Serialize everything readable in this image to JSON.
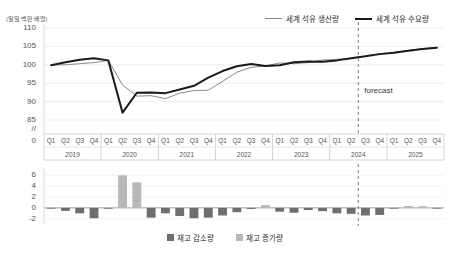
{
  "chart_data": [
    {
      "type": "line",
      "title": "",
      "ylabel": "(일일 백만 배럴)",
      "xlabel": "",
      "ylim": [
        83,
        110
      ],
      "yticks": [
        110,
        105,
        100,
        95,
        90,
        85
      ],
      "axis_break": "//",
      "axis_zero": "0",
      "grid": true,
      "legend_position": "top-right",
      "x": [
        "Q1",
        "Q2",
        "Q3",
        "Q4",
        "Q1",
        "Q2",
        "Q3",
        "Q4",
        "Q1",
        "Q2",
        "Q3",
        "Q4",
        "Q1",
        "Q2",
        "Q3",
        "Q4",
        "Q1",
        "Q2",
        "Q3",
        "Q4",
        "Q1",
        "Q2",
        "Q3",
        "Q4",
        "Q1",
        "Q2",
        "Q3",
        "Q4"
      ],
      "year_groups": [
        {
          "year": "2019",
          "quarters": [
            "Q1",
            "Q2",
            "Q3",
            "Q4"
          ]
        },
        {
          "year": "2020",
          "quarters": [
            "Q1",
            "Q2",
            "Q3",
            "Q4"
          ]
        },
        {
          "year": "2021",
          "quarters": [
            "Q1",
            "Q2",
            "Q3",
            "Q4"
          ]
        },
        {
          "year": "2022",
          "quarters": [
            "Q1",
            "Q2",
            "Q3",
            "Q4"
          ]
        },
        {
          "year": "2023",
          "quarters": [
            "Q1",
            "Q2",
            "Q3",
            "Q4"
          ]
        },
        {
          "year": "2024",
          "quarters": [
            "Q1",
            "Q2",
            "Q3",
            "Q4"
          ]
        },
        {
          "year": "2025",
          "quarters": [
            "Q1",
            "Q2",
            "Q3",
            "Q4"
          ]
        }
      ],
      "annotations": [
        {
          "text": "forecast",
          "at_x_index": 21.5
        }
      ],
      "series": [
        {
          "name": "세계 석유 생산량",
          "color": "#8a8a8a",
          "width": 1,
          "values": [
            100.0,
            100.0,
            100.3,
            100.6,
            101.2,
            94.5,
            91.5,
            91.6,
            90.8,
            92.3,
            93.0,
            93.1,
            95.5,
            98.0,
            99.3,
            99.7,
            100.5,
            100.3,
            100.6,
            101.3,
            101.5,
            101.7,
            102.4,
            103.0,
            103.4,
            103.9,
            104.4,
            104.7
          ]
        },
        {
          "name": "세계 석유 수요량",
          "color": "#1a1a1a",
          "width": 2,
          "values": [
            99.9,
            100.7,
            101.4,
            101.8,
            101.2,
            87.0,
            92.4,
            92.5,
            92.3,
            93.3,
            94.3,
            96.5,
            98.3,
            99.6,
            100.2,
            99.7,
            99.9,
            100.7,
            100.9,
            100.8,
            101.2,
            101.8,
            102.3,
            102.9,
            103.3,
            103.8,
            104.3,
            104.6
          ]
        }
      ]
    },
    {
      "type": "bar",
      "title": "",
      "ylim": [
        -2.6,
        6.6
      ],
      "yticks": [
        6,
        4,
        2,
        0,
        -2
      ],
      "grid": true,
      "legend_position": "bottom-center",
      "categories": [
        "Q1",
        "Q2",
        "Q3",
        "Q4",
        "Q1",
        "Q2",
        "Q3",
        "Q4",
        "Q1",
        "Q2",
        "Q3",
        "Q4",
        "Q1",
        "Q2",
        "Q3",
        "Q4",
        "Q1",
        "Q2",
        "Q3",
        "Q4",
        "Q1",
        "Q2",
        "Q3",
        "Q4",
        "Q1",
        "Q2",
        "Q3",
        "Q4"
      ],
      "values": [
        -0.15,
        -0.55,
        -1.0,
        -1.9,
        -0.1,
        6.0,
        4.7,
        -1.8,
        -1.0,
        -1.5,
        -1.9,
        -1.8,
        -1.4,
        -0.8,
        -0.2,
        0.5,
        -0.7,
        -0.9,
        -0.4,
        -0.6,
        -1.0,
        -1.1,
        -1.4,
        -1.3,
        -0.1,
        0.35,
        0.3,
        -0.1
      ],
      "legend": [
        {
          "name": "재고 감소량",
          "color": "#6e6e6e"
        },
        {
          "name": "재고 증가량",
          "color": "#b8b8b8"
        }
      ]
    }
  ],
  "chart": {
    "unit_label": "(일일 백만 배럴)",
    "forecast_label": "forecast",
    "legend_top": [
      {
        "label": "세계 석유 생산량",
        "style": "thin"
      },
      {
        "label": "세계 석유 수요량",
        "style": "bold"
      }
    ],
    "legend_bottom": [
      {
        "label": "재고 감소량",
        "color": "#6e6e6e"
      },
      {
        "label": "재고 증가량",
        "color": "#b8b8b8"
      }
    ]
  }
}
